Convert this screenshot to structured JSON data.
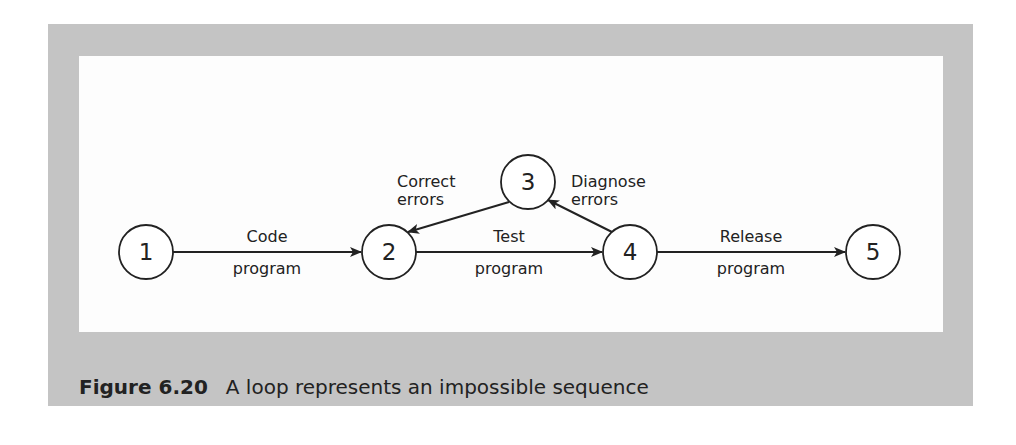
{
  "diagram": {
    "nodes": [
      {
        "id": "1",
        "label": "1",
        "cx": 67,
        "cy": 196
      },
      {
        "id": "2",
        "label": "2",
        "cx": 310,
        "cy": 196
      },
      {
        "id": "3",
        "label": "3",
        "cx": 449,
        "cy": 126
      },
      {
        "id": "4",
        "label": "4",
        "cx": 551,
        "cy": 196
      },
      {
        "id": "5",
        "label": "5",
        "cx": 794,
        "cy": 196
      }
    ],
    "edges": [
      {
        "from": "1",
        "to": "2",
        "label_top": "Code",
        "label_bottom": "program"
      },
      {
        "from": "2",
        "to": "4",
        "label_top": "Test",
        "label_bottom": "program"
      },
      {
        "from": "4",
        "to": "3",
        "label_top": "Diagnose",
        "label_bottom": "errors"
      },
      {
        "from": "3",
        "to": "2",
        "label_top": "Correct",
        "label_bottom": "errors"
      },
      {
        "from": "4",
        "to": "5",
        "label_top": "Release",
        "label_bottom": "program"
      }
    ]
  },
  "caption": {
    "number": "Figure 6.20",
    "text": "A loop represents an impossible sequence"
  },
  "colors": {
    "frame": "#c4c4c4",
    "panel": "#fdfdfd",
    "ink": "#222222"
  }
}
